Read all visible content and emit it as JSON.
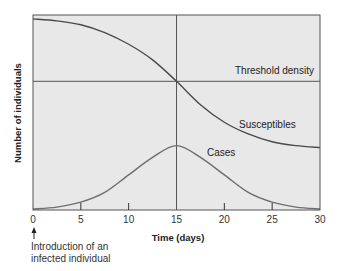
{
  "chart_data": {
    "type": "line",
    "title": "",
    "xlabel": "Time (days)",
    "ylabel": "Number of individuals",
    "xlim": [
      0,
      30
    ],
    "ylim": [
      0,
      100
    ],
    "x_ticks": [
      0,
      5,
      10,
      15,
      20,
      25,
      30
    ],
    "y_ticks": [],
    "grid": false,
    "legend": "none (inline labels)",
    "x": [
      0,
      2.5,
      5,
      7.5,
      10,
      12.5,
      15,
      17.5,
      20,
      22.5,
      25,
      27.5,
      30
    ],
    "series": [
      {
        "name": "Susceptibles",
        "color": "#4a4a4a",
        "values": [
          98,
          97,
          95,
          91,
          85,
          77,
          66,
          54,
          45,
          39,
          35,
          33,
          32
        ]
      },
      {
        "name": "Cases",
        "color": "#6e6e6e",
        "values": [
          0.5,
          1.5,
          4,
          9,
          18,
          27,
          33,
          27,
          18,
          9,
          4,
          1.5,
          0.5
        ]
      }
    ],
    "reference_lines": [
      {
        "type": "horizontal",
        "y": 66,
        "label": "Threshold density"
      },
      {
        "type": "vertical",
        "x": 15,
        "label": ""
      }
    ],
    "annotations": [
      {
        "text": "Threshold density",
        "x": 20.5,
        "y": 70
      },
      {
        "text": "Susceptibles",
        "x": 22,
        "y": 44
      },
      {
        "text": "Cases",
        "x": 18.5,
        "y": 30
      },
      {
        "text": "Introduction of an infected individual",
        "x": 0,
        "arrow": "up",
        "position": "below x-axis at 0"
      }
    ]
  },
  "labels": {
    "ylabel": "Number of individuals",
    "xlabel": "Time (days)",
    "threshold": "Threshold density",
    "susceptibles": "Susceptibles",
    "cases": "Cases",
    "intro_line1": "Introduction of an",
    "intro_line2": "infected individual",
    "ticks": [
      "0",
      "5",
      "10",
      "15",
      "20",
      "25",
      "30"
    ]
  },
  "colors": {
    "plot_bg": "#e8e8e8",
    "frame": "#555555",
    "susceptibles": "#4a4a4a",
    "cases": "#6e6e6e",
    "reference": "#555555"
  }
}
